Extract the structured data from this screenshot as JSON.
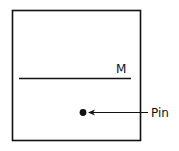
{
  "diagram": {
    "line_label": "M",
    "pin_label": "Pin",
    "colors": {
      "stroke": "#111111",
      "background": "#ffffff"
    }
  }
}
